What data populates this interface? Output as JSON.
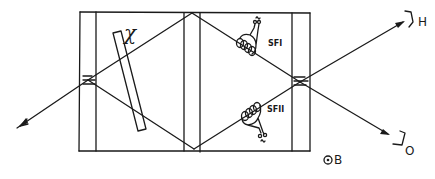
{
  "diagram": {
    "type": "optical-interferometer-schematic",
    "labels": {
      "phase_plate": "χ",
      "spin_flipper_1": "SFI",
      "spin_flipper_2": "SFII",
      "detector_h": "H",
      "detector_o": "O",
      "magnetic_field": "ʘB",
      "magnetic_field_symbol": "⊙",
      "magnetic_field_letter": "B",
      "ac_symbol": "~"
    },
    "components": [
      {
        "id": "incident-beam",
        "label": "",
        "kind": "arrow"
      },
      {
        "id": "beam-splitter-left",
        "label": "",
        "kind": "crystal-plate"
      },
      {
        "id": "mirror-center",
        "label": "",
        "kind": "crystal-plate"
      },
      {
        "id": "beam-splitter-right",
        "label": "",
        "kind": "crystal-plate"
      },
      {
        "id": "phase-shifter",
        "label": "χ",
        "kind": "plate"
      },
      {
        "id": "spin-flipper-1",
        "label": "SFI",
        "kind": "coil"
      },
      {
        "id": "spin-flipper-2",
        "label": "SFII",
        "kind": "coil"
      },
      {
        "id": "detector-h",
        "label": "H",
        "kind": "detector"
      },
      {
        "id": "detector-o",
        "label": "O",
        "kind": "detector"
      }
    ],
    "colors": {
      "ink": "#1a1a1a",
      "background": "#ffffff"
    }
  }
}
